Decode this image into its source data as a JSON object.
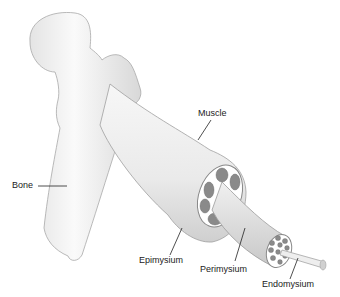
{
  "diagram": {
    "labels": {
      "bone": "Bone",
      "muscle": "Muscle",
      "epimysium": "Epimysium",
      "perimysium": "Perimysium",
      "endomysium": "Endomysium"
    },
    "colors": {
      "background": "#ffffff",
      "bone_fill": "#f2f2f2",
      "outline": "#9a9a9a",
      "fascicle_fill": "#8a8a8a",
      "label_text": "#222222"
    }
  }
}
